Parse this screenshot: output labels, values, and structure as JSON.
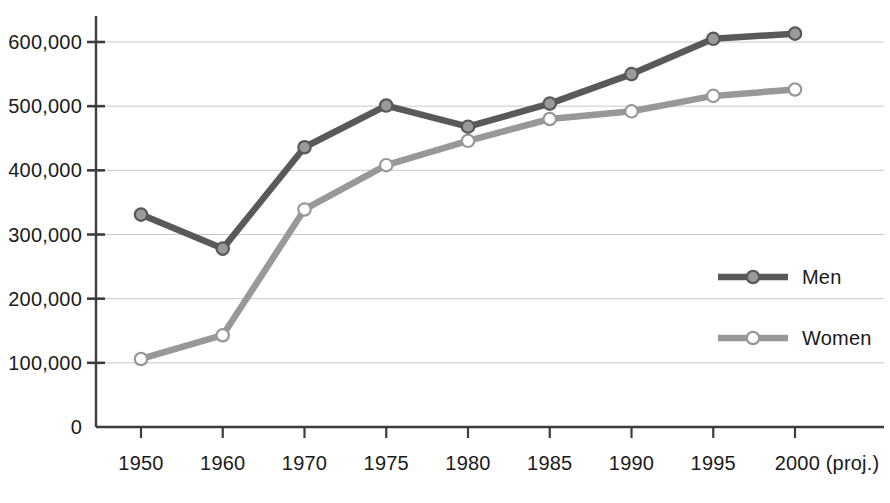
{
  "chart_data": {
    "type": "line",
    "title": "",
    "subtitle": "",
    "xlabel": "",
    "ylabel": "",
    "categories": [
      "1950",
      "1960",
      "1970",
      "1975",
      "1980",
      "1985",
      "1990",
      "1995",
      "2000 (proj.)"
    ],
    "x_tick_labels": [
      "1950",
      "1960",
      "1970",
      "1975",
      "1980",
      "1985",
      "1990",
      "1995",
      "2000 (proj.)"
    ],
    "y_tick_labels": [
      "0",
      "100,000",
      "200,000",
      "300,000",
      "400,000",
      "500,000",
      "600,000"
    ],
    "y_tick_values": [
      0,
      100000,
      200000,
      300000,
      400000,
      500000,
      600000
    ],
    "ylim": [
      0,
      640000
    ],
    "grid": "horizontal",
    "legend_position": "right-middle",
    "series": [
      {
        "name": "Men",
        "color": "#595959",
        "marker": "filled-circle",
        "marker_fill": "#9a9a9a",
        "values": [
          331000,
          278000,
          436000,
          501000,
          468000,
          504000,
          550000,
          605000,
          613000
        ]
      },
      {
        "name": "Women",
        "color": "#989898",
        "marker": "hollow-circle",
        "marker_fill": "#ffffff",
        "values": [
          106000,
          143000,
          339000,
          408000,
          446000,
          480000,
          492000,
          516000,
          526000
        ]
      }
    ],
    "legend": [
      {
        "label": "Men",
        "color": "#595959",
        "marker": "filled-circle"
      },
      {
        "label": "Women",
        "color": "#989898",
        "marker": "hollow-circle"
      }
    ],
    "axis_color": "#3d3d3d",
    "grid_color": "#c8c8c8"
  }
}
